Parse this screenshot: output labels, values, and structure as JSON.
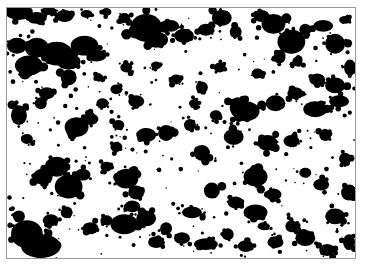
{
  "image": {
    "description": "Binary thresholded micrograph: black particle clusters on white background",
    "frame": {
      "x": 6,
      "y": 7,
      "width": 350,
      "height": 252,
      "border_color": "#9a9a9a"
    },
    "colors": {
      "background": "#ffffff",
      "particle": "#000000"
    },
    "blobs": [
      [
        12,
        4,
        14,
        8
      ],
      [
        30,
        10,
        10,
        6
      ],
      [
        42,
        3,
        8,
        4
      ],
      [
        58,
        8,
        9,
        6
      ],
      [
        80,
        6,
        6,
        4
      ],
      [
        100,
        4,
        5,
        4
      ],
      [
        118,
        10,
        6,
        5
      ],
      [
        10,
        38,
        10,
        8
      ],
      [
        30,
        40,
        12,
        10
      ],
      [
        22,
        58,
        14,
        10
      ],
      [
        50,
        46,
        16,
        12
      ],
      [
        62,
        54,
        12,
        8
      ],
      [
        78,
        38,
        14,
        10
      ],
      [
        90,
        48,
        10,
        6
      ],
      [
        140,
        20,
        16,
        14
      ],
      [
        150,
        32,
        12,
        8
      ],
      [
        165,
        18,
        8,
        6
      ],
      [
        178,
        28,
        10,
        7
      ],
      [
        200,
        22,
        8,
        6
      ],
      [
        216,
        10,
        10,
        8
      ],
      [
        230,
        24,
        6,
        6
      ],
      [
        256,
        8,
        8,
        6
      ],
      [
        268,
        16,
        12,
        10
      ],
      [
        286,
        34,
        14,
        12
      ],
      [
        300,
        22,
        6,
        6
      ],
      [
        318,
        18,
        10,
        6
      ],
      [
        330,
        36,
        10,
        10
      ],
      [
        345,
        60,
        6,
        8
      ],
      [
        340,
        12,
        6,
        4
      ],
      [
        274,
        50,
        6,
        6
      ],
      [
        252,
        66,
        6,
        5
      ],
      [
        292,
        54,
        5,
        5
      ],
      [
        312,
        72,
        8,
        6
      ],
      [
        330,
        78,
        10,
        8
      ],
      [
        18,
        66,
        6,
        6
      ],
      [
        40,
        86,
        8,
        6
      ],
      [
        62,
        70,
        8,
        8
      ],
      [
        70,
        120,
        12,
        10
      ],
      [
        84,
        112,
        8,
        6
      ],
      [
        96,
        96,
        6,
        5
      ],
      [
        112,
        118,
        6,
        5
      ],
      [
        34,
        96,
        6,
        6
      ],
      [
        12,
        108,
        8,
        10
      ],
      [
        20,
        132,
        6,
        5
      ],
      [
        50,
        160,
        12,
        10
      ],
      [
        36,
        170,
        10,
        8
      ],
      [
        62,
        180,
        14,
        12
      ],
      [
        76,
        168,
        8,
        6
      ],
      [
        100,
        160,
        6,
        5
      ],
      [
        120,
        172,
        12,
        10
      ],
      [
        130,
        186,
        8,
        7
      ],
      [
        110,
        140,
        6,
        5
      ],
      [
        140,
        128,
        10,
        7
      ],
      [
        160,
        126,
        8,
        8
      ],
      [
        184,
        118,
        6,
        6
      ],
      [
        196,
        146,
        8,
        8
      ],
      [
        228,
        130,
        10,
        8
      ],
      [
        240,
        104,
        14,
        10
      ],
      [
        232,
        100,
        8,
        10
      ],
      [
        270,
        96,
        10,
        8
      ],
      [
        290,
        86,
        8,
        6
      ],
      [
        310,
        102,
        12,
        8
      ],
      [
        334,
        94,
        10,
        6
      ],
      [
        320,
        128,
        6,
        6
      ],
      [
        286,
        134,
        8,
        6
      ],
      [
        262,
        136,
        10,
        8
      ],
      [
        250,
        170,
        12,
        10
      ],
      [
        268,
        188,
        8,
        6
      ],
      [
        300,
        166,
        6,
        5
      ],
      [
        316,
        178,
        8,
        6
      ],
      [
        340,
        152,
        6,
        6
      ],
      [
        344,
        186,
        8,
        8
      ],
      [
        330,
        210,
        10,
        8
      ],
      [
        300,
        232,
        10,
        8
      ],
      [
        286,
        220,
        6,
        6
      ],
      [
        270,
        236,
        8,
        6
      ],
      [
        250,
        206,
        12,
        8
      ],
      [
        230,
        196,
        8,
        6
      ],
      [
        206,
        184,
        8,
        8
      ],
      [
        186,
        206,
        10,
        6
      ],
      [
        176,
        232,
        8,
        6
      ],
      [
        160,
        222,
        6,
        6
      ],
      [
        140,
        212,
        10,
        8
      ],
      [
        118,
        218,
        14,
        10
      ],
      [
        126,
        200,
        8,
        6
      ],
      [
        100,
        214,
        6,
        5
      ],
      [
        84,
        222,
        8,
        6
      ],
      [
        60,
        206,
        6,
        6
      ],
      [
        44,
        214,
        8,
        6
      ],
      [
        20,
        228,
        16,
        14
      ],
      [
        34,
        240,
        20,
        12
      ],
      [
        12,
        210,
        6,
        6
      ],
      [
        150,
        236,
        8,
        6
      ],
      [
        200,
        238,
        12,
        6
      ],
      [
        222,
        228,
        6,
        6
      ],
      [
        240,
        240,
        8,
        6
      ],
      [
        258,
        220,
        6,
        4
      ],
      [
        322,
        244,
        8,
        6
      ],
      [
        344,
        236,
        6,
        8
      ],
      [
        110,
        82,
        6,
        5
      ],
      [
        130,
        94,
        8,
        6
      ],
      [
        170,
        72,
        6,
        5
      ],
      [
        196,
        80,
        6,
        6
      ],
      [
        214,
        60,
        6,
        5
      ],
      [
        150,
        58,
        5,
        4
      ],
      [
        120,
        60,
        6,
        5
      ],
      [
        92,
        70,
        5,
        4
      ],
      [
        188,
        96,
        5,
        4
      ],
      [
        210,
        108,
        6,
        5
      ]
    ]
  }
}
